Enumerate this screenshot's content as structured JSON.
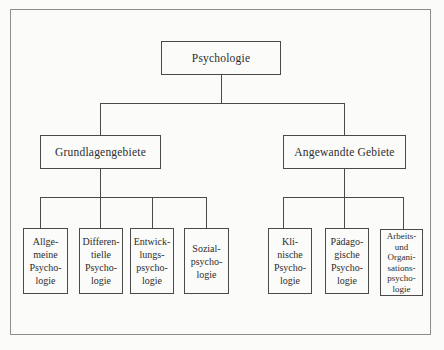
{
  "nodes": {
    "root": {
      "label": "Psychologie"
    },
    "left_branch": {
      "label": "Grundlagengebiete"
    },
    "right_branch": {
      "label": "Angewandte Gebiete"
    },
    "left_leaves": [
      {
        "label": "Allge-\nmeine\nPsycho-\nlogie"
      },
      {
        "label": "Differen-\ntielle\nPsycho-\nlogie"
      },
      {
        "label": "Entwick-\nlungs-\npsycho-\nlogie"
      },
      {
        "label": "Sozial-\npsycho-\nlogie"
      }
    ],
    "right_leaves": [
      {
        "label": "Kli-\nnische\nPsycho-\nlogie"
      },
      {
        "label": "Pädago-\ngische\nPsycho-\nlogie"
      },
      {
        "label": "Arbeits-\nund\nOrgani-\nsations-\npsycho-\nlogie"
      }
    ]
  },
  "colors": {
    "background": "#fbfbf9",
    "outer_border": "#8d8d8d",
    "box_border": "#4a4a4a",
    "line": "#4a4a4a",
    "text": "#2d2d2d"
  }
}
